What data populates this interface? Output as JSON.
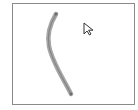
{
  "canvas": {
    "border_color": "#8a8a8a",
    "background": "#ffffff"
  },
  "stroke": {
    "color": "#9a9a9a",
    "center_color": "#7a7a7a",
    "width": 4,
    "points": [
      [
        56,
        14
      ],
      [
        49,
        40
      ],
      [
        71,
        94
      ]
    ]
  },
  "cursor": {
    "icon": "arrow-pointer-icon",
    "x": 83,
    "y": 22
  }
}
